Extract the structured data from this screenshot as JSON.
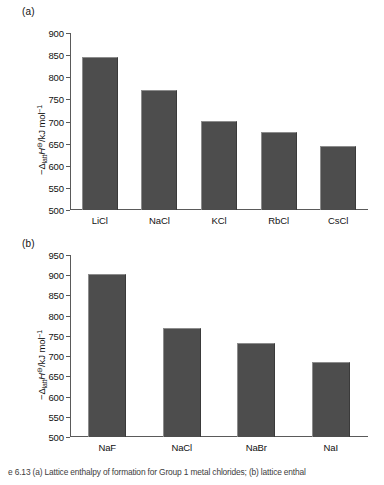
{
  "figure": {
    "caption": "e 6.13 (a) Lattice enthalpy of formation for Group 1 metal chlorides; (b) lattice enthal"
  },
  "panels": [
    {
      "id": "a",
      "label": "(a)",
      "ylabel_prefix": "−Δ",
      "ylabel_sub": "latt",
      "ylabel_symbol": "H",
      "ylabel_sup": "⊖",
      "ylabel_unit": "/kJ mol",
      "ylabel_unit_sup": "−1"
    },
    {
      "id": "b",
      "label": "(b)",
      "ylabel_prefix": "−Δ",
      "ylabel_sub": "latt",
      "ylabel_symbol": "H",
      "ylabel_sup": "⊖",
      "ylabel_unit": "/kJ mol",
      "ylabel_unit_sup": "−1"
    }
  ],
  "chart_data": [
    {
      "type": "bar",
      "panel": "a",
      "title": "(a)",
      "categories": [
        "LiCl",
        "NaCl",
        "KCl",
        "RbCl",
        "CsCl"
      ],
      "values": [
        845,
        771,
        701,
        676,
        645
      ],
      "xlabel": "",
      "ylabel": "−ΔlattH⊖/kJ mol−1",
      "ylim": [
        500,
        900
      ],
      "yticks": [
        500,
        550,
        600,
        650,
        700,
        750,
        800,
        850,
        900
      ],
      "ytick_labels": [
        "500",
        "550",
        "600",
        "650",
        "700",
        "750",
        "800",
        "850",
        "900"
      ],
      "grid": false,
      "legend": "none",
      "bar_color": "#4d4d4d"
    },
    {
      "type": "bar",
      "panel": "b",
      "title": "(b)",
      "categories": [
        "NaF",
        "NaCl",
        "NaBr",
        "NaI"
      ],
      "values": [
        902,
        770,
        733,
        686
      ],
      "xlabel": "",
      "ylabel": "−ΔlattH⊖/kJ mol−1",
      "ylim": [
        500,
        950
      ],
      "yticks": [
        500,
        550,
        600,
        650,
        700,
        750,
        800,
        850,
        900,
        950
      ],
      "ytick_labels": [
        "500",
        "550",
        "600",
        "650",
        "700",
        "750",
        "800",
        "850",
        "900",
        "950"
      ],
      "grid": false,
      "legend": "none",
      "bar_color": "#4d4d4d"
    }
  ]
}
